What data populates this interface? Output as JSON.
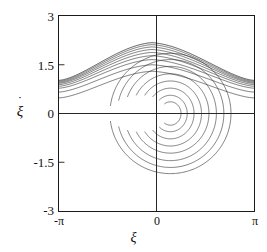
{
  "figure": {
    "kind": "phase-portrait",
    "background": "#ffffff",
    "curve_color": "#2b2b2b"
  },
  "axes": {
    "x_title": "ξ",
    "y_title_symbol": "ξ",
    "y_title_dot": "˙",
    "y_ticks": [
      {
        "label": "3",
        "value": 3
      },
      {
        "label": "1.5",
        "value": 1.5
      },
      {
        "label": "0",
        "value": 0
      },
      {
        "label": "-1.5",
        "value": -1.5
      },
      {
        "label": "-3",
        "value": -3
      }
    ],
    "x_ticks": [
      {
        "label": "-π",
        "value": -3.14159
      },
      {
        "label": "0",
        "value": 0
      },
      {
        "label": "π",
        "value": 3.14159
      }
    ]
  },
  "chart_data": {
    "type": "line",
    "title": "",
    "xlabel": "ξ",
    "ylabel": "ξ̇",
    "xlim": [
      -3.14159,
      3.14159
    ],
    "ylim": [
      -3,
      3
    ],
    "grid": false,
    "legend": "none",
    "x_tick_labels": [
      "-π",
      "0",
      "π"
    ],
    "x_tick_values": [
      -3.14159,
      0,
      3.14159
    ],
    "y_tick_labels": [
      "3",
      "1.5",
      "0",
      "-1.5",
      "-3"
    ],
    "y_tick_values": [
      3,
      1.5,
      0,
      -1.5,
      -3
    ],
    "center_fixed_point": [
      0.45,
      0
    ],
    "saddle_points": [
      [
        -3.14159,
        1.0
      ],
      [
        3.14159,
        1.0
      ]
    ],
    "separatrix": {
      "name": "separatrix",
      "peak": [
        -0.15,
        2.18
      ],
      "edge_values": [
        1.02,
        1.02
      ],
      "points_xy": [
        [
          -3.14159,
          1.02
        ],
        [
          -2.85,
          1.06
        ],
        [
          -2.55,
          1.14
        ],
        [
          -2.25,
          1.28
        ],
        [
          -1.95,
          1.46
        ],
        [
          -1.65,
          1.66
        ],
        [
          -1.35,
          1.86
        ],
        [
          -1.05,
          2.02
        ],
        [
          -0.75,
          2.12
        ],
        [
          -0.45,
          2.17
        ],
        [
          -0.15,
          2.18
        ],
        [
          0.15,
          2.16
        ],
        [
          0.45,
          2.11
        ],
        [
          0.75,
          2.02
        ],
        [
          1.05,
          1.9
        ],
        [
          1.35,
          1.74
        ],
        [
          1.65,
          1.56
        ],
        [
          1.95,
          1.38
        ],
        [
          2.25,
          1.22
        ],
        [
          2.55,
          1.11
        ],
        [
          2.85,
          1.04
        ],
        [
          3.14159,
          1.02
        ]
      ]
    },
    "series": [
      {
        "name": "open-orbit-1",
        "type": "librating",
        "edge_y": 1.02,
        "peak_y": 2.18
      },
      {
        "name": "open-orbit-2",
        "type": "librating",
        "edge_y": 0.99,
        "peak_y": 2.12
      },
      {
        "name": "open-orbit-3",
        "type": "librating",
        "edge_y": 0.96,
        "peak_y": 2.05
      },
      {
        "name": "open-orbit-4",
        "type": "librating",
        "edge_y": 0.93,
        "peak_y": 1.97
      },
      {
        "name": "open-orbit-5",
        "type": "librating",
        "edge_y": 0.89,
        "peak_y": 1.88
      },
      {
        "name": "open-orbit-6",
        "type": "librating",
        "edge_y": 0.84,
        "peak_y": 1.78
      },
      {
        "name": "open-orbit-7",
        "type": "librating",
        "edge_y": 0.78,
        "peak_y": 1.66
      },
      {
        "name": "open-orbit-8",
        "type": "librating",
        "edge_y": 0.66,
        "peak_y": 1.5
      },
      {
        "name": "open-orbit-9",
        "type": "librating",
        "edge_y": 0.48,
        "peak_y": 1.3
      },
      {
        "name": "closed-orbit-1",
        "type": "closed",
        "radius_x": 1.95,
        "radius_y": 1.85
      },
      {
        "name": "closed-orbit-2",
        "type": "closed",
        "radius_x": 1.72,
        "radius_y": 1.66
      },
      {
        "name": "closed-orbit-3",
        "type": "closed",
        "radius_x": 1.48,
        "radius_y": 1.45
      },
      {
        "name": "closed-orbit-4",
        "type": "closed",
        "radius_x": 1.24,
        "radius_y": 1.22
      },
      {
        "name": "closed-orbit-5",
        "type": "closed",
        "radius_x": 1.0,
        "radius_y": 1.0
      },
      {
        "name": "closed-orbit-6",
        "type": "closed",
        "radius_x": 0.76,
        "radius_y": 0.78
      },
      {
        "name": "closed-orbit-7",
        "type": "closed",
        "radius_x": 0.54,
        "radius_y": 0.56
      },
      {
        "name": "closed-orbit-8",
        "type": "closed",
        "radius_x": 0.34,
        "radius_y": 0.36
      }
    ]
  }
}
